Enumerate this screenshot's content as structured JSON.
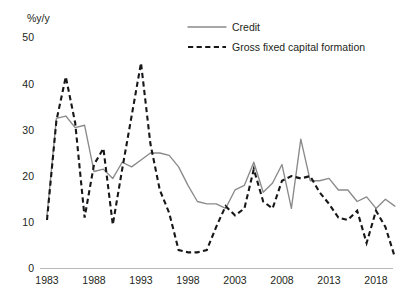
{
  "chart_data": {
    "type": "line",
    "title": "",
    "subtitle": "",
    "xlabel": "",
    "ylabel": "%y/y",
    "ylim": [
      0,
      55
    ],
    "xlim": [
      1983,
      2020
    ],
    "grid": false,
    "legend_position": "top-center",
    "ytick_labels": [
      "50",
      "40",
      "30",
      "20",
      "10",
      "0"
    ],
    "ytick_values": [
      50,
      40,
      30,
      20,
      10,
      0
    ],
    "xtick_labels": [
      "1983",
      "1988",
      "1993",
      "1998",
      "2003",
      "2008",
      "2013",
      "2018"
    ],
    "xtick_values": [
      1983,
      1988,
      1993,
      1998,
      2003,
      2008,
      2013,
      2018
    ],
    "x": [
      1983,
      1984,
      1985,
      1986,
      1987,
      1988,
      1989,
      1990,
      1991,
      1992,
      1993,
      1994,
      1995,
      1996,
      1997,
      1998,
      1999,
      2000,
      2001,
      2002,
      2003,
      2004,
      2005,
      2006,
      2007,
      2008,
      2009,
      2010,
      2011,
      2012,
      2013,
      2014,
      2015,
      2016,
      2017,
      2018,
      2019,
      2020
    ],
    "series": [
      {
        "name": "Credit",
        "style": "solid",
        "color": "#8a8a8a",
        "values": [
          11.5,
          32.5,
          33.0,
          30.5,
          31.0,
          21.0,
          21.5,
          19.5,
          23.0,
          22.0,
          23.5,
          25.0,
          25.0,
          24.5,
          22.0,
          18.0,
          14.5,
          14.0,
          14.0,
          13.0,
          17.0,
          18.0,
          23.0,
          16.5,
          18.5,
          22.5,
          13.0,
          28.0,
          19.0,
          19.0,
          19.5,
          17.0,
          17.0,
          14.5,
          15.5,
          13.0,
          15.0,
          13.5
        ]
      },
      {
        "name": "Gross fixed capital formation",
        "style": "dashed",
        "color": "#17171a",
        "values": [
          10.5,
          32.0,
          41.5,
          31.5,
          11.0,
          22.5,
          26.0,
          9.5,
          21.5,
          33.0,
          44.5,
          27.0,
          17.0,
          12.0,
          4.0,
          3.5,
          3.5,
          4.0,
          9.0,
          13.5,
          11.5,
          13.0,
          21.5,
          14.5,
          13.0,
          19.0,
          20.0,
          19.5,
          20.0,
          16.5,
          14.0,
          11.0,
          10.5,
          12.5,
          5.5,
          12.5,
          9.0,
          2.5
        ]
      }
    ]
  },
  "legend": {
    "items": [
      {
        "label": "Credit",
        "style": "solid",
        "color": "#8a8a8a"
      },
      {
        "label": "Gross fixed capital formation",
        "style": "dashed",
        "color": "#17171a"
      }
    ]
  },
  "axis": {
    "y_unit_label": "%y/y"
  }
}
